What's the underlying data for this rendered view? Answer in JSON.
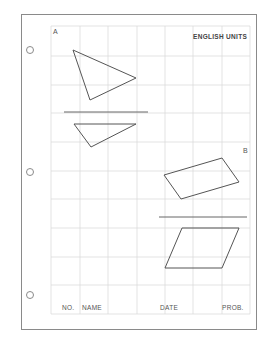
{
  "sheet": {
    "units_label": "ENGLISH UNITS",
    "problem_labels": {
      "a": "A",
      "b": "B"
    },
    "title_block": {
      "number_label": "NO.",
      "name_label": "NAME",
      "date_label": "DATE",
      "problem_label": "PROB."
    },
    "binder_holes": 3,
    "grid": {
      "columns": 7,
      "rows": 10
    }
  },
  "colors": {
    "grid_line": "#d9d9d9",
    "shape_line": "#555555",
    "border": "#8a8a8a",
    "paper": "#ffffff"
  }
}
